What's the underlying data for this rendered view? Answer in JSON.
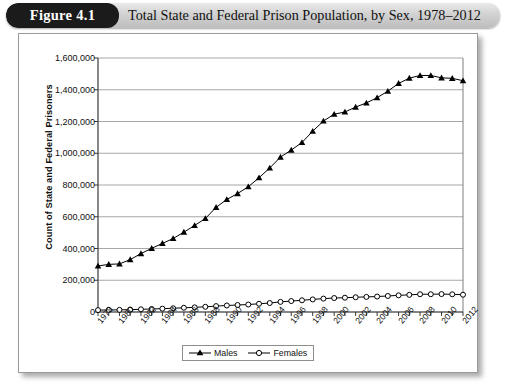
{
  "header": {
    "badge": "Figure 4.1",
    "title": "Total State and Federal Prison Population, by Sex, 1978–2012"
  },
  "legend": {
    "males_label": "Males",
    "females_label": "Females"
  },
  "chart_data": {
    "type": "line",
    "title": "Total State and Federal Prison Population, by Sex, 1978–2012",
    "xlabel": "",
    "ylabel": "Count of State and Federal Prisoners",
    "ylim": [
      0,
      1600000
    ],
    "ytick_labels": [
      "1,600,000",
      "1,400,000",
      "1,200,000",
      "1,000,000",
      "800,000",
      "600,000",
      "400,000",
      "200,000",
      "0"
    ],
    "ytick_values": [
      1600000,
      1400000,
      1200000,
      1000000,
      800000,
      600000,
      400000,
      200000,
      0
    ],
    "grid": true,
    "legend_position": "bottom-center",
    "x": [
      1978,
      1979,
      1980,
      1981,
      1982,
      1983,
      1984,
      1985,
      1986,
      1987,
      1988,
      1989,
      1990,
      1991,
      1992,
      1993,
      1994,
      1995,
      1996,
      1997,
      1998,
      1999,
      2000,
      2001,
      2002,
      2003,
      2004,
      2005,
      2006,
      2007,
      2008,
      2009,
      2010,
      2011,
      2012
    ],
    "xtick_labels": [
      "1978",
      "1980",
      "1982",
      "1984",
      "1986",
      "1988",
      "1990",
      "1992",
      "1994",
      "1996",
      "1998",
      "2000",
      "2002",
      "2004",
      "2006",
      "2008",
      "2010",
      "2012"
    ],
    "series": [
      {
        "name": "Males",
        "marker": "filled-triangle",
        "values": [
          290000,
          300000,
          303000,
          330000,
          368000,
          401000,
          432000,
          463000,
          503000,
          545000,
          589000,
          659000,
          709000,
          746000,
          789000,
          846000,
          907000,
          976000,
          1020000,
          1068000,
          1139000,
          1203000,
          1246000,
          1260000,
          1291000,
          1317000,
          1350000,
          1391000,
          1440000,
          1473000,
          1490000,
          1490000,
          1475000,
          1472000,
          1457000
        ]
      },
      {
        "name": "Females",
        "marker": "open-circle",
        "values": [
          12000,
          13000,
          13400,
          15000,
          17000,
          19000,
          21000,
          23500,
          26600,
          29200,
          32700,
          37300,
          41000,
          44000,
          47100,
          51800,
          56500,
          63700,
          69000,
          73700,
          79300,
          84400,
          87900,
          90000,
          92900,
          95100,
          97400,
          101000,
          105000,
          108000,
          112000,
          112000,
          112800,
          111400,
          108800
        ]
      }
    ]
  }
}
